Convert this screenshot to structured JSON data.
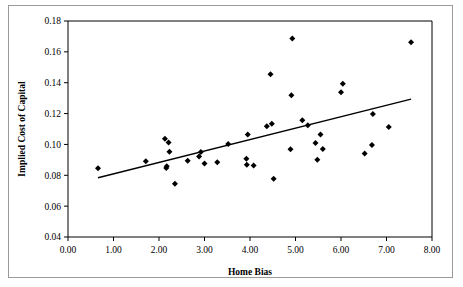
{
  "chart_data": {
    "type": "scatter",
    "title": "",
    "xlabel": "Home Bias",
    "ylabel": "Implied Cost of Capital",
    "xlim": [
      0.0,
      8.0
    ],
    "ylim": [
      0.04,
      0.18
    ],
    "xticks": [
      "0.00",
      "1.00",
      "2.00",
      "3.00",
      "4.00",
      "5.00",
      "6.00",
      "7.00",
      "8.00"
    ],
    "xtick_values": [
      0.0,
      1.0,
      2.0,
      3.0,
      4.0,
      5.0,
      6.0,
      7.0,
      8.0
    ],
    "yticks": [
      "0.04",
      "0.06",
      "0.08",
      "0.10",
      "0.12",
      "0.14",
      "0.16",
      "0.18"
    ],
    "ytick_values": [
      0.04,
      0.06,
      0.08,
      0.1,
      0.12,
      0.14,
      0.16,
      0.18
    ],
    "grid": false,
    "legend": "none",
    "marker": "diamond",
    "marker_color": "#000000",
    "points": [
      {
        "x": 0.66,
        "y": 0.0845
      },
      {
        "x": 1.71,
        "y": 0.0891
      },
      {
        "x": 2.13,
        "y": 0.1037
      },
      {
        "x": 2.16,
        "y": 0.0848
      },
      {
        "x": 2.17,
        "y": 0.0858
      },
      {
        "x": 2.21,
        "y": 0.1013
      },
      {
        "x": 2.23,
        "y": 0.0953
      },
      {
        "x": 2.35,
        "y": 0.0745
      },
      {
        "x": 2.63,
        "y": 0.0895
      },
      {
        "x": 2.88,
        "y": 0.0922
      },
      {
        "x": 2.92,
        "y": 0.0951
      },
      {
        "x": 3.0,
        "y": 0.0876
      },
      {
        "x": 3.28,
        "y": 0.0885
      },
      {
        "x": 3.52,
        "y": 0.1003
      },
      {
        "x": 3.92,
        "y": 0.0907
      },
      {
        "x": 3.93,
        "y": 0.0869
      },
      {
        "x": 3.95,
        "y": 0.1064
      },
      {
        "x": 4.08,
        "y": 0.0863
      },
      {
        "x": 4.37,
        "y": 0.1118
      },
      {
        "x": 4.45,
        "y": 0.1455
      },
      {
        "x": 4.48,
        "y": 0.1134
      },
      {
        "x": 4.52,
        "y": 0.0778
      },
      {
        "x": 4.89,
        "y": 0.0968
      },
      {
        "x": 4.91,
        "y": 0.1318
      },
      {
        "x": 4.93,
        "y": 0.1687
      },
      {
        "x": 5.15,
        "y": 0.1156
      },
      {
        "x": 5.27,
        "y": 0.1125
      },
      {
        "x": 5.44,
        "y": 0.101
      },
      {
        "x": 5.48,
        "y": 0.0901
      },
      {
        "x": 5.55,
        "y": 0.1065
      },
      {
        "x": 5.6,
        "y": 0.0971
      },
      {
        "x": 6.0,
        "y": 0.1338
      },
      {
        "x": 6.04,
        "y": 0.1393
      },
      {
        "x": 6.52,
        "y": 0.0941
      },
      {
        "x": 6.68,
        "y": 0.0996
      },
      {
        "x": 6.7,
        "y": 0.1197
      },
      {
        "x": 7.05,
        "y": 0.1113
      },
      {
        "x": 7.54,
        "y": 0.1663
      }
    ],
    "trend_line": {
      "x_start": 0.66,
      "y_start": 0.0784,
      "x_end": 7.54,
      "y_end": 0.1293
    }
  }
}
